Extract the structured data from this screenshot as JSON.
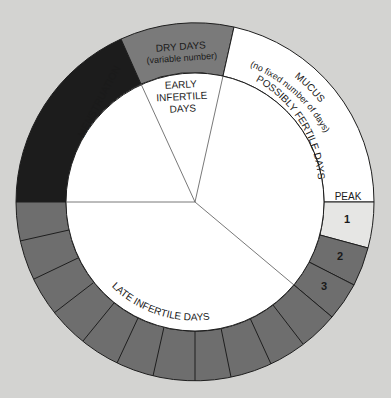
{
  "diagram": {
    "title": "",
    "colors": {
      "background": "#d3d3d1",
      "menstruation": "#1c1c1c",
      "dry_days": "#7a7a7a",
      "mucus": "#ffffff",
      "peak_day_1": "#e6e6e4",
      "post_peak_days": "#6e6e6e",
      "late_infertile_ring": "#6e6e6e",
      "inner_disc": "#ffffff"
    },
    "outer_ring": {
      "segments": [
        {
          "name": "menstruation",
          "label": ""
        },
        {
          "name": "dry-days",
          "label": "DRY DAYS",
          "sublabel": "(variable number)"
        },
        {
          "name": "mucus",
          "label": "MUCUS",
          "sublabel": "(no fixed number of days)"
        },
        {
          "name": "peak",
          "label": "PEAK"
        },
        {
          "name": "post-peak-day-1",
          "label": "1"
        },
        {
          "name": "post-peak-day-2",
          "label": "2"
        },
        {
          "name": "post-peak-day-3",
          "label": "3"
        }
      ],
      "late_infertile_day_boxes": 11
    },
    "inner_sectors": [
      {
        "name": "menstruation",
        "label": "MENSTRUATION"
      },
      {
        "name": "early-infertile-days",
        "lines": [
          "EARLY",
          "INFERTILE",
          "DAYS"
        ]
      },
      {
        "name": "possibly-fertile-days",
        "label": "POSSIBLY FERTILE DAYS"
      },
      {
        "name": "late-infertile-days",
        "label": "LATE INFERTILE DAYS"
      }
    ]
  }
}
